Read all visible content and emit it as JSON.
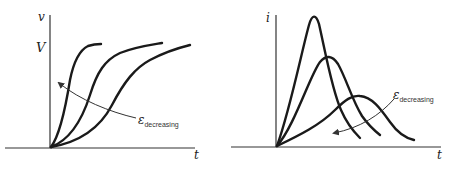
{
  "left_panel": {
    "y_axis_label": "v",
    "y_level_label": "V",
    "x_axis_label": "t",
    "annotation": {
      "symbol": "ε",
      "subscript": "decreasing"
    },
    "description": "Sigmoidal voltage rise curves; steeper rise as epsilon decreases"
  },
  "right_panel": {
    "y_axis_label": "i",
    "x_axis_label": "t",
    "annotation": {
      "symbol": "ε",
      "subscript": "decreasing"
    },
    "description": "Current pulse curves; taller, earlier peaks as epsilon decreases"
  },
  "colors": {
    "curve": "#1a1a1a",
    "axis": "#333333",
    "background": "#ffffff"
  }
}
